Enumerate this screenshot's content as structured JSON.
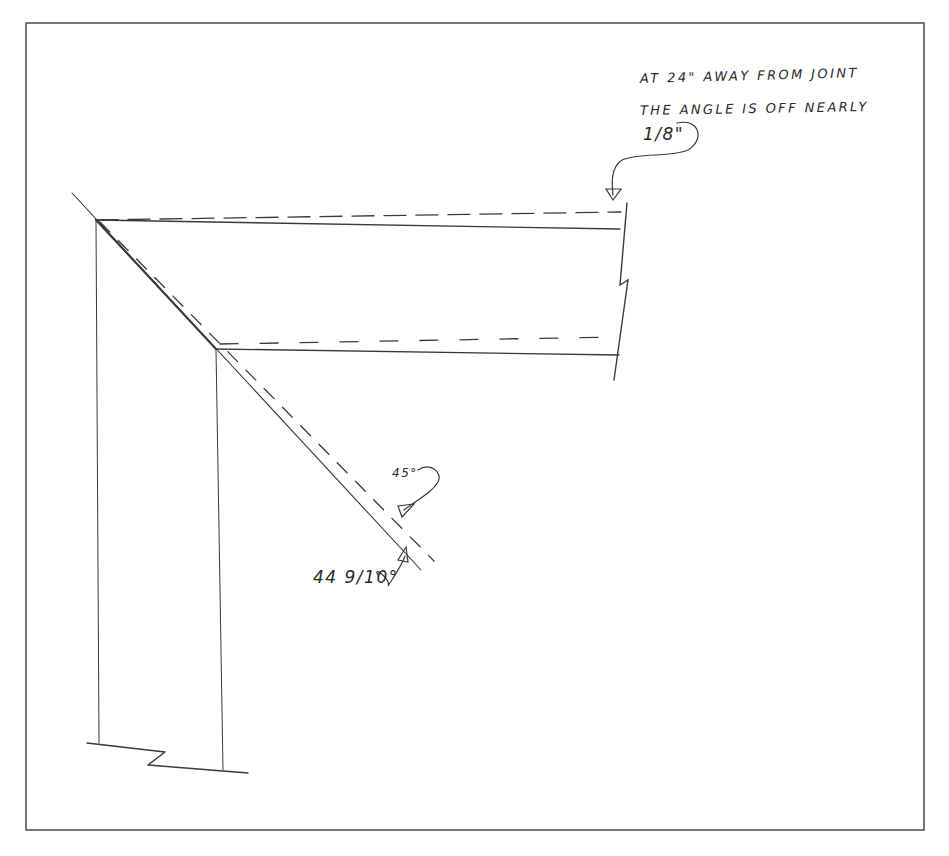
{
  "diagram": {
    "type": "hand-drawn miter joint sketch",
    "frame": {
      "x": 26,
      "y": 23,
      "width": 898,
      "height": 807,
      "stroke": "#555555"
    },
    "line_color": "#3a3a3a",
    "annotations": {
      "note_line_1": "AT 24\" AWAY FROM JOINT",
      "note_line_2": "THE ANGLE IS OFF NEARLY",
      "note_line_3": "1/8\"",
      "angle_expected": "45°",
      "angle_actual": "44 9/10°"
    },
    "elements": [
      {
        "id": "outer-top-edge-solid",
        "style": "solid",
        "from": [
          96,
          220
        ],
        "to": [
          620,
          229
        ]
      },
      {
        "id": "outer-top-edge-dashed",
        "style": "dashed",
        "from": [
          96,
          220
        ],
        "to": [
          620,
          212
        ]
      },
      {
        "id": "inner-top-edge-solid",
        "style": "solid",
        "from": [
          216,
          349
        ],
        "to": [
          619,
          355
        ]
      },
      {
        "id": "inner-top-edge-dashed",
        "style": "dashed",
        "from": [
          218,
          344
        ],
        "to": [
          619,
          337
        ]
      },
      {
        "id": "miter-line-solid",
        "style": "solid",
        "from": [
          72,
          193
        ],
        "to": [
          421,
          570
        ]
      },
      {
        "id": "miter-line-dashed",
        "style": "dashed",
        "from": [
          100,
          222
        ],
        "to": [
          434,
          561
        ]
      },
      {
        "id": "outer-left-edge",
        "style": "solid",
        "from": [
          96,
          220
        ],
        "to": [
          99,
          743
        ]
      },
      {
        "id": "inner-left-edge",
        "style": "solid",
        "from": [
          216,
          349
        ],
        "to": [
          223,
          770
        ]
      },
      {
        "id": "right-break-line",
        "style": "solid"
      },
      {
        "id": "bottom-break-line",
        "style": "solid"
      }
    ]
  }
}
